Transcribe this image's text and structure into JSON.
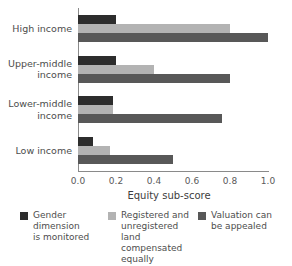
{
  "chart_data": {
    "type": "bar",
    "orientation": "horizontal",
    "title": "",
    "xlabel": "Equity sub-score",
    "ylabel": "",
    "xlim": [
      0.0,
      1.0
    ],
    "ylim": null,
    "grid": false,
    "legend_position": "bottom",
    "categories": [
      "High income",
      "Upper-middle\nincome",
      "Lower-middle\nincome",
      "Low income"
    ],
    "xticks": [
      "0.0",
      "0.2",
      "0.4",
      "0.6",
      "0.8",
      "1.0"
    ],
    "xtick_values": [
      0.0,
      0.2,
      0.4,
      0.6,
      0.8,
      1.0
    ],
    "series": [
      {
        "name": "Gender dimension\nis monitored",
        "color": "#2d2d2d",
        "values": [
          0.2,
          0.2,
          0.185,
          0.08
        ]
      },
      {
        "name": "Registered and\nunregistered land\ncompensated\nequally",
        "color": "#b3b3b3",
        "values": [
          0.8,
          0.4,
          0.185,
          0.17
        ]
      },
      {
        "name": "Valuation can\nbe appealed",
        "color": "#585858",
        "values": [
          1.0,
          0.8,
          0.76,
          0.5
        ]
      }
    ]
  },
  "axes": {
    "spine_color": "#8a8a8a",
    "background": "#ffffff"
  }
}
